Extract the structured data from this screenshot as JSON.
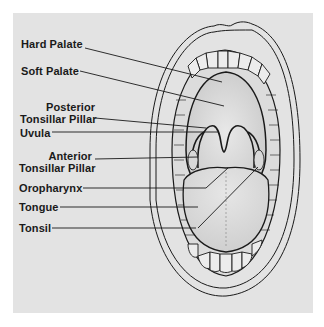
{
  "diagram": {
    "background_color": "#e3e3e3",
    "line_color": "#1a1a1a",
    "labels": [
      {
        "id": "hard-palate",
        "text": "Hard Palate"
      },
      {
        "id": "soft-palate",
        "text": "Soft Palate"
      },
      {
        "id": "posterior-tonsillar-pillar",
        "line1": "Posterior",
        "line2": "Tonsillar Pillar"
      },
      {
        "id": "uvula",
        "text": "Uvula"
      },
      {
        "id": "anterior-tonsillar-pillar",
        "line1": "Anterior",
        "line2": "Tonsillar Pillar"
      },
      {
        "id": "oropharynx",
        "text": "Oropharynx"
      },
      {
        "id": "tongue",
        "text": "Tongue"
      },
      {
        "id": "tonsil",
        "text": "Tonsil"
      }
    ]
  }
}
